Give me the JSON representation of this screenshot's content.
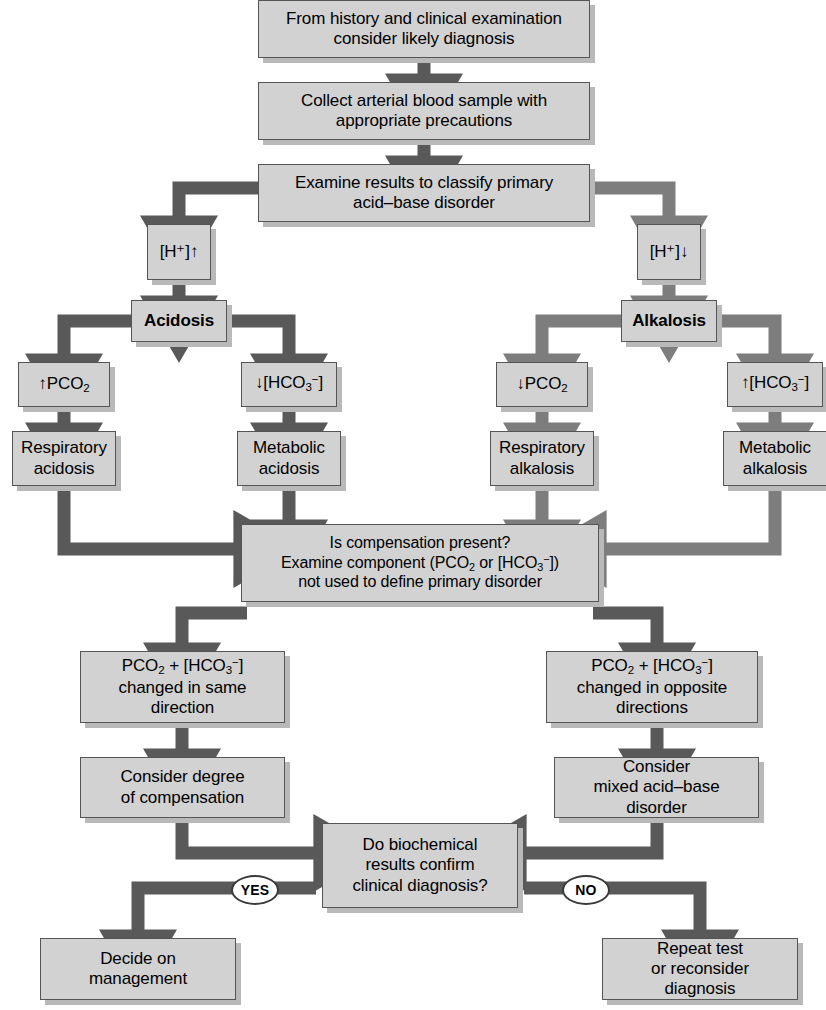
{
  "diagram": {
    "colors": {
      "box_fill": "#d2d2d2",
      "box_border": "#555555",
      "box_shadow": "#b9b9b9",
      "arrow": "#595959",
      "arrow_light": "#7d7d7d",
      "background": "#ffffff",
      "badge_border": "#3a3a3a"
    }
  },
  "nodes": {
    "history": {
      "line1": "From history and clinical examination",
      "line2": "consider likely diagnosis"
    },
    "collect": {
      "line1": "Collect arterial blood sample with",
      "line2": "appropriate precautions"
    },
    "examine": {
      "line1": "Examine results to classify primary",
      "line2": "acid–base disorder"
    },
    "h_up": {
      "label": "[H⁺]↑"
    },
    "h_down": {
      "label": "[H⁺]↓"
    },
    "acidosis": {
      "label": "Acidosis"
    },
    "alkalosis": {
      "label": "Alkalosis"
    },
    "pco2_up": {
      "label": "↑PCO₂"
    },
    "hco3_down": {
      "label": "↓[HCO₃⁻]"
    },
    "pco2_down": {
      "label": "↓PCO₂"
    },
    "hco3_up": {
      "label": "↑[HCO₃⁻]"
    },
    "resp_acidosis": {
      "line1": "Respiratory",
      "line2": "acidosis"
    },
    "metab_acidosis": {
      "line1": "Metabolic",
      "line2": "acidosis"
    },
    "resp_alkalosis": {
      "line1": "Respiratory",
      "line2": "alkalosis"
    },
    "metab_alkalosis": {
      "line1": "Metabolic",
      "line2": "alkalosis"
    },
    "compensation": {
      "line1": "Is compensation present?",
      "line2": "Examine component (PCO₂ or [HCO₃⁻])",
      "line3": "not used to define primary disorder"
    },
    "same_direction": {
      "line1": "PCO₂ + [HCO₃⁻]",
      "line2": "changed in same",
      "line3": "direction"
    },
    "opposite_directions": {
      "line1": "PCO₂ + [HCO₃⁻]",
      "line2": "changed in opposite",
      "line3": "directions"
    },
    "consider_degree": {
      "line1": "Consider degree",
      "line2": "of compensation"
    },
    "consider_mixed": {
      "line1": "Consider",
      "line2": "mixed acid–base",
      "line3": "disorder"
    },
    "decision": {
      "line1": "Do biochemical",
      "line2": "results confirm",
      "line3": "clinical diagnosis?"
    },
    "decide_mgmt": {
      "line1": "Decide on",
      "line2": "management"
    },
    "repeat_test": {
      "line1": "Repeat test",
      "line2": "or reconsider",
      "line3": "diagnosis"
    }
  },
  "badges": {
    "yes": "YES",
    "no": "NO"
  }
}
